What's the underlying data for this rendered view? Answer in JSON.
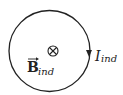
{
  "diagram": {
    "loop": {
      "shape": "circle",
      "current_direction": "clockwise"
    },
    "field_symbol": "⊗",
    "field_direction": "into-page",
    "field_label": {
      "base": "B",
      "subscript": "ind",
      "vector_arrow": "→"
    },
    "current_label": {
      "base": "I",
      "subscript": "ind"
    },
    "colors": {
      "stroke": "#222222",
      "background": "#ffffff"
    }
  }
}
